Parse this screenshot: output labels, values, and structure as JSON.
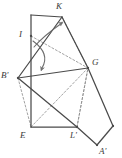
{
  "figure": {
    "width": 122,
    "height": 158,
    "background_color": "#ffffff",
    "stroke_color": "#4a4a4a",
    "dashed_color": "#8c8c8c",
    "arrow_color": "#6e6e6e",
    "label_color": "#3a3a3a"
  },
  "vertices": [
    {
      "name": "K",
      "label": "K",
      "x": 62,
      "y": 17,
      "label_x": 56,
      "label_y": 2
    },
    {
      "name": "I",
      "label": "I",
      "x": 31,
      "y": 36,
      "label_x": 19,
      "label_y": 30
    },
    {
      "name": "Bp",
      "label": "B'",
      "x": 18,
      "y": 78,
      "label_x": 1,
      "label_y": 71
    },
    {
      "name": "G",
      "label": "G",
      "x": 88,
      "y": 68,
      "label_x": 92,
      "label_y": 58
    },
    {
      "name": "E",
      "label": "E",
      "x": 31,
      "y": 127,
      "label_x": 20,
      "label_y": 131
    },
    {
      "name": "Lp",
      "label": "L'",
      "x": 77,
      "y": 127,
      "label_x": 70,
      "label_y": 131
    },
    {
      "name": "Ap",
      "label": "A'",
      "x": 97,
      "y": 145,
      "label_x": 99,
      "label_y": 147
    },
    {
      "name": "T",
      "label": "",
      "x": 31,
      "y": 15,
      "label_x": 0,
      "label_y": 0
    },
    {
      "name": "R",
      "label": "",
      "x": 113,
      "y": 126,
      "label_x": 0,
      "label_y": 0
    }
  ],
  "solid_edges": [
    {
      "name": "edge-top-rect",
      "from": "T",
      "to": "K"
    },
    {
      "name": "edge-left-rect",
      "from": "T",
      "to": "E"
    },
    {
      "name": "edge-bottom-rect",
      "from": "E",
      "to": "Lp"
    },
    {
      "name": "edge-bprime-k",
      "from": "Bp",
      "to": "K"
    },
    {
      "name": "edge-bprime-g",
      "from": "Bp",
      "to": "G"
    },
    {
      "name": "edge-bprime-lprime",
      "from": "Bp",
      "to": "Lp"
    },
    {
      "name": "edge-k-g",
      "from": "K",
      "to": "G"
    },
    {
      "name": "edge-g-right",
      "from": "G",
      "to": "R"
    },
    {
      "name": "edge-right-aprime",
      "from": "R",
      "to": "Ap"
    },
    {
      "name": "edge-aprime-lprime",
      "from": "Ap",
      "to": "Lp"
    }
  ],
  "dashed_edges": [
    {
      "name": "fold-i-g",
      "from": "I",
      "to": "G"
    },
    {
      "name": "fold-k-g-inner",
      "from": "K",
      "to": "G"
    },
    {
      "name": "fold-e-g",
      "from": "E",
      "to": "G"
    },
    {
      "name": "fold-lprime-g",
      "from": "Lp",
      "to": "G"
    },
    {
      "name": "fold-bprime-e",
      "from": "Bp",
      "to": "E"
    },
    {
      "name": "fold-lprime-up",
      "from": "Lp",
      "to": "G"
    }
  ],
  "arrows": [
    {
      "name": "fold-arrow-up",
      "path": "M 34 47 C 40 40 52 30 62 23",
      "tip_x": 63,
      "tip_y": 22,
      "tip_angle": -35
    },
    {
      "name": "fold-arrow-down",
      "path": "M 33 41 C 44 49 48 58 42 68",
      "tip_x": 41,
      "tip_y": 71,
      "tip_angle": 110
    }
  ],
  "points": [
    {
      "name": "point-i",
      "x": 31,
      "y": 36
    },
    {
      "name": "point-bprime",
      "x": 18,
      "y": 78
    },
    {
      "name": "point-g",
      "x": 88,
      "y": 68
    },
    {
      "name": "point-lprime",
      "x": 77,
      "y": 127
    },
    {
      "name": "point-right",
      "x": 113,
      "y": 126
    },
    {
      "name": "point-aprime",
      "x": 97,
      "y": 145
    }
  ]
}
